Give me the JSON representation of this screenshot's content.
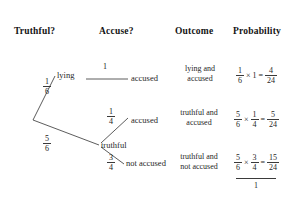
{
  "headers": {
    "truthful": "Truthful?",
    "accuse": "Accuse?",
    "outcome": "Outcome",
    "probability": "Probability"
  },
  "tree": {
    "level1": [
      {
        "label": "lying",
        "prob_num": "1",
        "prob_den": "6"
      },
      {
        "label": "truthful",
        "prob_num": "5",
        "prob_den": "6"
      }
    ],
    "level2": [
      {
        "label": "accused",
        "prob": "1",
        "prob_num": "",
        "prob_den": ""
      },
      {
        "label": "accused",
        "prob": "",
        "prob_num": "1",
        "prob_den": "4"
      },
      {
        "label": "not accused",
        "prob": "",
        "prob_num": "3",
        "prob_den": "4"
      }
    ]
  },
  "outcomes": [
    {
      "line1": "lying and",
      "line2": "accused"
    },
    {
      "line1": "truthful and",
      "line2": "accused"
    },
    {
      "line1": "truthful and",
      "line2": "not accused"
    }
  ],
  "probabilities": [
    {
      "a_num": "1",
      "a_den": "6",
      "operator": "×",
      "b_whole": "1",
      "equals": "=",
      "result_num": "4",
      "result_den": "24"
    },
    {
      "a_num": "5",
      "a_den": "6",
      "operator": "×",
      "b_num": "1",
      "b_den": "4",
      "equals": "=",
      "result_num": "5",
      "result_den": "24"
    },
    {
      "a_num": "5",
      "a_den": "6",
      "operator": "×",
      "b_num": "3",
      "b_den": "4",
      "equals": "=",
      "result_num": "15",
      "result_den": "24"
    }
  ],
  "total": "1",
  "colors": {
    "line": "#4a4a4a",
    "text": "#1f1f1f",
    "background": "#ffffff"
  }
}
